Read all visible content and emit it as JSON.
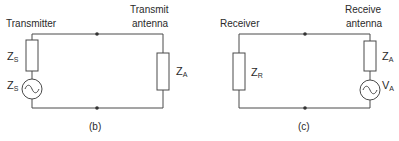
{
  "diagrams": [
    {
      "id": "b",
      "caption": "(b)",
      "left_label": "Transmitter",
      "right_label_line1": "Transmit",
      "right_label_line2": "antenna",
      "left_components": [
        {
          "type": "resistor",
          "symbol": "Z",
          "subscript": "S"
        },
        {
          "type": "ac-source",
          "symbol": "Z",
          "subscript": "S"
        }
      ],
      "right_components": [
        {
          "type": "resistor",
          "symbol": "Z",
          "subscript": "A"
        }
      ]
    },
    {
      "id": "c",
      "caption": "(c)",
      "left_label": "Receiver",
      "right_label_line1": "Receive",
      "right_label_line2": "antenna",
      "left_components": [
        {
          "type": "resistor",
          "symbol": "Z",
          "subscript": "R"
        }
      ],
      "right_components": [
        {
          "type": "resistor",
          "symbol": "Z",
          "subscript": "A"
        },
        {
          "type": "ac-source",
          "symbol": "V",
          "subscript": "A"
        }
      ]
    }
  ],
  "colors": {
    "line": "#4a4a4a",
    "text": "#2a2a2a",
    "background": "#ffffff"
  }
}
